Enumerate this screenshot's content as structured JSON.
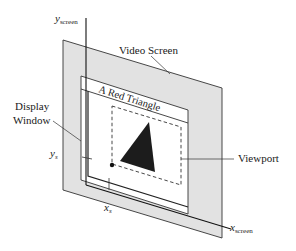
{
  "diagram": {
    "labels": {
      "y_axis_main": "y",
      "y_axis_sub": "screen",
      "x_axis_main": "x",
      "x_axis_sub": "screen",
      "video_screen": "Video Screen",
      "display_window_line1": "Display",
      "display_window_line2": "Window",
      "window_title": "A Red Triangle",
      "viewport": "Viewport",
      "ys_main": "y",
      "ys_sub": "s",
      "xs_main": "x",
      "xs_sub": "s"
    },
    "colors": {
      "screen_fill": "#e2e2e2",
      "stroke": "#333333",
      "window_fill": "#ffffff",
      "triangle_fill": "#1c1c1c"
    }
  }
}
